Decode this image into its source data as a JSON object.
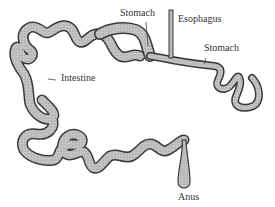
{
  "diagram": {
    "labels": {
      "stomach_left": "Stomach",
      "esophagus": "Esophagus",
      "stomach_right": "Stomach",
      "intestine": "Intestine",
      "anus": "Anus"
    },
    "colors": {
      "tube_fill": "#b8b8b8",
      "tube_stroke": "#3a3a3a",
      "text": "#333333",
      "background": "#ffffff"
    }
  }
}
